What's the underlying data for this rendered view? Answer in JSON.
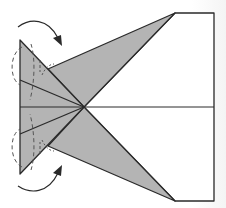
{
  "diagram": {
    "type": "origami-fold-step",
    "colors": {
      "paper_front": "#ffffff",
      "paper_back": "#b4b4b4",
      "line": "#2a2a2a",
      "dashed": "#555555",
      "arrow": "#2a2a2a"
    },
    "elements": {
      "rectangle_body": "white rectangular end (right side)",
      "midline": "horizontal center crease",
      "upper_flap": "gray triangular flap pointing up-right",
      "lower_flap": "gray triangular flap pointing down-right",
      "left_wedge": "gray pleated wedge on the left with radial creases",
      "upper_arrow": "curved fold arrow (top, pointing down-right)",
      "lower_arrow": "curved fold arrow (bottom, pointing up-right)",
      "dashed_arcs": "dashed fold-behind guide curves on left edge"
    }
  }
}
